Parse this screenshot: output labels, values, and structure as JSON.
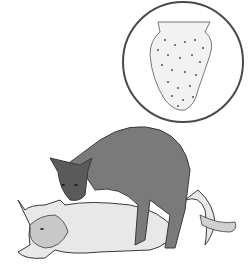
{
  "image": {
    "width": 250,
    "height": 277,
    "background": "#ffffff",
    "description": "Grayscale illustration of two cats mating with an inset circle showing a magnified barbed penis",
    "inset": {
      "shape": "circle",
      "cx": 183,
      "cy": 62,
      "r": 60,
      "border_color": "#4a4a4a"
    },
    "colors": {
      "dark_cat": "#7a7a7a",
      "dark_cat_shade": "#5a5a5a",
      "light_cat": "#e8e8e8",
      "light_cat_shade": "#b8b8b8",
      "outline": "#3a3a3a",
      "inset_fill": "#f2f2f2",
      "barb_dots": "#555555"
    }
  }
}
